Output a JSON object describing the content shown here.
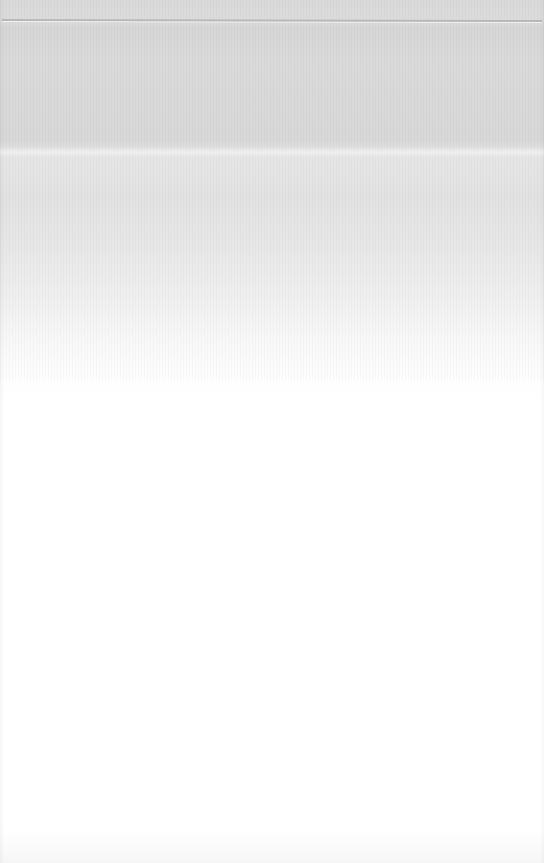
{
  "screen": {
    "state": "faded-blank",
    "colors": {
      "top_gray": "#d9d9d9",
      "rule_line": "#b8b8b8",
      "bottom_white": "#ffffff"
    },
    "illegible_text": ""
  }
}
